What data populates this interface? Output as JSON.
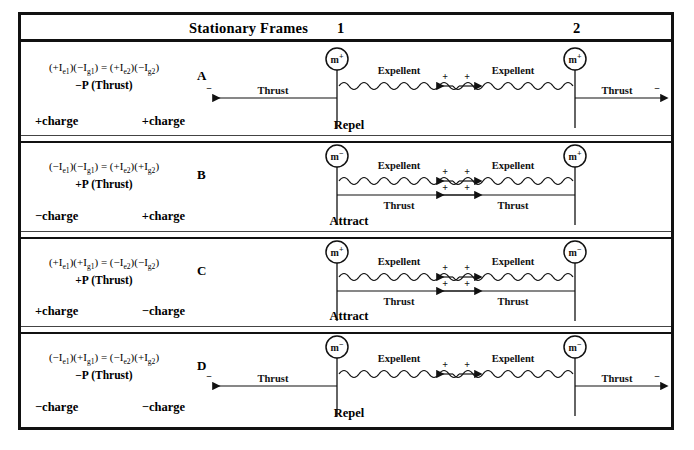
{
  "header": {
    "title": "Stationary Frames",
    "frame_1": "1",
    "frame_2": "2"
  },
  "labels": {
    "expellent": "Expellent",
    "thrust": "Thrust",
    "plus_sign": "+",
    "minus_sign": "−",
    "m_positive": "m",
    "m_negative": "m"
  },
  "rows": [
    {
      "letter": "A",
      "equation": "(+I",
      "equation_full": "(+Ie1)(−Ig1) = (+Ie2)(−Ig2)",
      "momentum": "−P (Thrust)",
      "charge_left": "+charge",
      "charge_right": "+charge",
      "verdict": "Repel",
      "mass_left": "m⁺",
      "mass_right": "m⁺",
      "eq_parts": {
        "p1_sign": "+",
        "p1_sym": "I",
        "p1_sub": "e1",
        "p2_sign": "−",
        "p2_sym": "I",
        "p2_sub": "g1",
        "p3_sign": "+",
        "p3_sym": "I",
        "p3_sub": "e2",
        "p4_sign": "−",
        "p4_sym": "I",
        "p4_sub": "g2"
      },
      "left_node": {
        "mass_charge": "+",
        "thrust_dir": "left",
        "thrust_sign": "−",
        "expellent_dir": "right",
        "expellent_sign": "+",
        "style": "repel"
      },
      "right_node": {
        "mass_charge": "+",
        "thrust_dir": "right",
        "thrust_sign": "−",
        "expellent_dir": "left",
        "expellent_sign": "+",
        "style": "repel"
      }
    },
    {
      "letter": "B",
      "equation_full": "(−Ie1)(−Ig1) = (+Ie2)(+Ig2)",
      "momentum": "+P (Thrust)",
      "charge_left": "−charge",
      "charge_right": "+charge",
      "verdict": "Attract",
      "mass_left": "m⁻",
      "mass_right": "m⁺",
      "eq_parts": {
        "p1_sign": "−",
        "p1_sym": "I",
        "p1_sub": "e1",
        "p2_sign": "−",
        "p2_sym": "I",
        "p2_sub": "g1",
        "p3_sign": "+",
        "p3_sym": "I",
        "p3_sub": "e2",
        "p4_sign": "+",
        "p4_sym": "I",
        "p4_sub": "g2"
      },
      "left_node": {
        "mass_charge": "−",
        "thrust_dir": "right",
        "thrust_sign": "+",
        "expellent_dir": "right",
        "expellent_sign": "+",
        "style": "attract"
      },
      "right_node": {
        "mass_charge": "+",
        "thrust_dir": "left",
        "thrust_sign": "+",
        "expellent_dir": "left",
        "expellent_sign": "+",
        "style": "attract"
      }
    },
    {
      "letter": "C",
      "equation_full": "(+Ie1)(+Ig1) = (−Ie2)(−Ig2)",
      "momentum": "+P (Thrust)",
      "charge_left": "+charge",
      "charge_right": "−charge",
      "verdict": "Attract",
      "mass_left": "m⁺",
      "mass_right": "m⁻",
      "eq_parts": {
        "p1_sign": "+",
        "p1_sym": "I",
        "p1_sub": "e1",
        "p2_sign": "+",
        "p2_sym": "I",
        "p2_sub": "g1",
        "p3_sign": "−",
        "p3_sym": "I",
        "p3_sub": "e2",
        "p4_sign": "−",
        "p4_sym": "I",
        "p4_sub": "g2"
      },
      "left_node": {
        "mass_charge": "+",
        "thrust_dir": "right",
        "thrust_sign": "+",
        "expellent_dir": "right",
        "expellent_sign": "+",
        "style": "attract"
      },
      "right_node": {
        "mass_charge": "−",
        "thrust_dir": "left",
        "thrust_sign": "+",
        "expellent_dir": "left",
        "expellent_sign": "+",
        "style": "attract"
      }
    },
    {
      "letter": "D",
      "equation_full": "(−Ie1)(+Ig1) = (−Ie2)(+Ig2)",
      "momentum": "−P (Thrust)",
      "charge_left": "−charge",
      "charge_right": "−charge",
      "verdict": "Repel",
      "mass_left": "m⁻",
      "mass_right": "m⁻",
      "eq_parts": {
        "p1_sign": "−",
        "p1_sym": "I",
        "p1_sub": "e1",
        "p2_sign": "+",
        "p2_sym": "I",
        "p2_sub": "g1",
        "p3_sign": "−",
        "p3_sym": "I",
        "p3_sub": "e2",
        "p4_sign": "+",
        "p4_sym": "I",
        "p4_sub": "g2"
      },
      "left_node": {
        "mass_charge": "−",
        "thrust_dir": "left",
        "thrust_sign": "−",
        "expellent_dir": "right",
        "expellent_sign": "+",
        "style": "repel"
      },
      "right_node": {
        "mass_charge": "−",
        "thrust_dir": "right",
        "thrust_sign": "−",
        "expellent_dir": "left",
        "expellent_sign": "+",
        "style": "repel"
      }
    }
  ],
  "colors": {
    "ink": "#111111",
    "background": "#ffffff",
    "rule": "#444444"
  }
}
